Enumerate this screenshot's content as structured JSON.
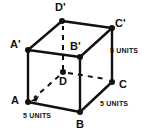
{
  "figure": {
    "shape": "cube",
    "stroke_color": "#111111",
    "background_color": "#ffffff",
    "vertices": [
      {
        "key": "Dp",
        "label": "D'",
        "x": 62,
        "y": 21,
        "hidden": false,
        "dot": true
      },
      {
        "key": "Cp",
        "label": "C'",
        "x": 112,
        "y": 28,
        "hidden": false,
        "dot": true
      },
      {
        "key": "Ap",
        "label": "A'",
        "x": 28,
        "y": 50,
        "hidden": false,
        "dot": true
      },
      {
        "key": "Bp",
        "label": "B'",
        "x": 80,
        "y": 57,
        "hidden": false,
        "dot": true
      },
      {
        "key": "D",
        "label": "D",
        "x": 63,
        "y": 72,
        "hidden": true,
        "dot": true
      },
      {
        "key": "C",
        "label": "C",
        "x": 112,
        "y": 82,
        "hidden": false,
        "dot": true
      },
      {
        "key": "A",
        "label": "A",
        "x": 28,
        "y": 102,
        "hidden": false,
        "dot": true
      },
      {
        "key": "B",
        "label": "B",
        "x": 80,
        "y": 112,
        "hidden": false,
        "dot": true
      }
    ],
    "edges_solid": [
      [
        "Ap",
        "Bp"
      ],
      [
        "Bp",
        "Cp"
      ],
      [
        "Cp",
        "Dp"
      ],
      [
        "Dp",
        "Ap"
      ],
      [
        "Ap",
        "A"
      ],
      [
        "Bp",
        "B"
      ],
      [
        "Cp",
        "C"
      ],
      [
        "A",
        "B"
      ],
      [
        "B",
        "C"
      ]
    ],
    "edges_dashed": [
      [
        "D",
        "Dp"
      ],
      [
        "D",
        "C"
      ],
      [
        "D",
        "A"
      ]
    ],
    "measurement_labels": [
      {
        "key": "units-right",
        "text": "5 UNITS",
        "edge": "C'-C",
        "x": 110,
        "y": 47
      },
      {
        "key": "units-bottomright",
        "text": "5 UNITS",
        "edge": "B-C",
        "x": 100,
        "y": 100
      },
      {
        "key": "units-bottomleft",
        "text": "5 UNITS",
        "edge": "A-B",
        "x": 23,
        "y": 112
      }
    ]
  }
}
